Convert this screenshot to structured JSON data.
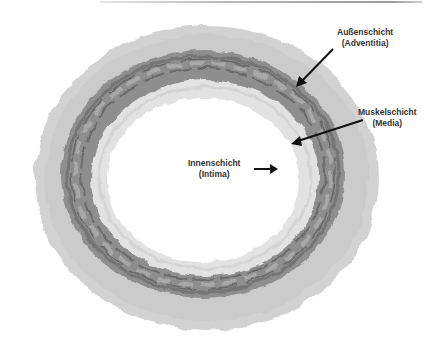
{
  "figure": {
    "colors": {
      "adventitia": "#cfcfcf",
      "media": "#8a8a8a",
      "media_fibers": "#6a6a6a",
      "intima": "#e4e4e4",
      "lumen": "#ffffff",
      "arrow": "#111111",
      "label_text": "#333333"
    }
  },
  "labels": {
    "adventitia": {
      "line1": "Außenschicht",
      "line2": "(Adventitia)"
    },
    "media": {
      "line1": "Muskelschicht",
      "line2": "(Media)"
    },
    "intima": {
      "line1": "Innenschicht",
      "line2": "(Intima)"
    }
  }
}
